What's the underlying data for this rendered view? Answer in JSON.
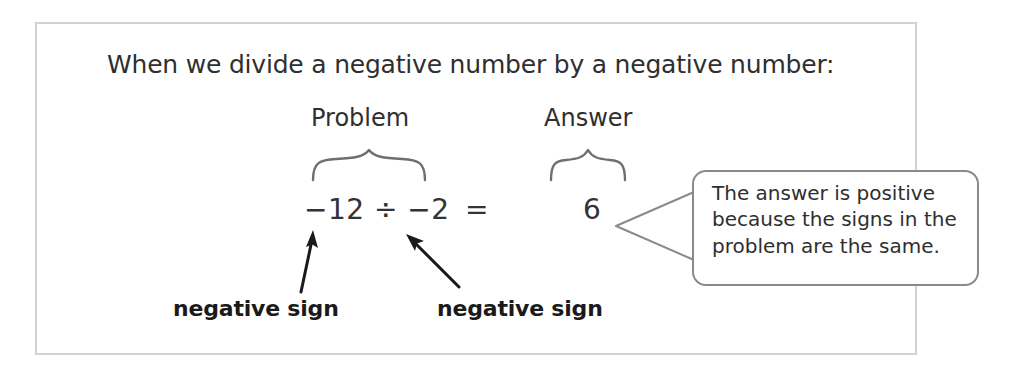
{
  "page": {
    "background_color": "#ffffff",
    "frame_border_color": "#d2d2d2",
    "text_color": "#2f2f2f",
    "callout_border_color": "#8a8a8a",
    "arrow_color": "#1a1a1a"
  },
  "intro": {
    "text": "When we divide a negative number by a negative number:"
  },
  "columns": {
    "problem_heading": "Problem",
    "answer_heading": "Answer"
  },
  "equation": {
    "problem": "−12 ÷ −2",
    "equals": "=",
    "answer": "6"
  },
  "annotations": {
    "left_sign_label": "negative sign",
    "right_sign_label": "negative sign"
  },
  "callout": {
    "text": "The answer is positive because the signs in the problem are the same."
  }
}
